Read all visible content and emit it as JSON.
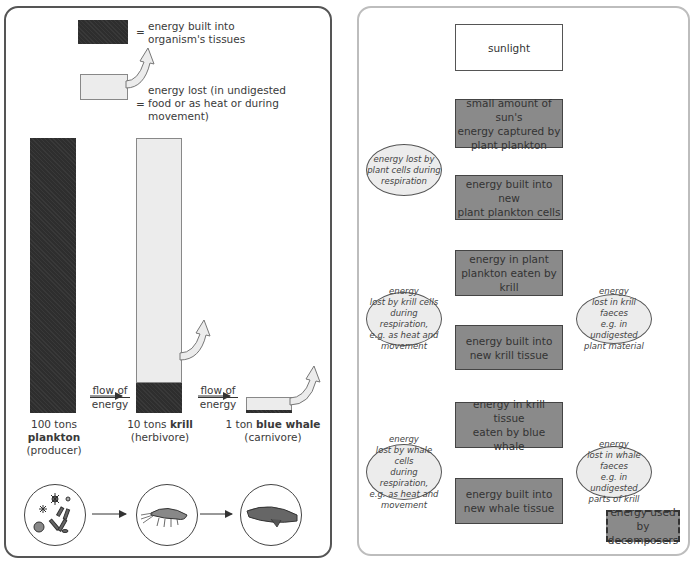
{
  "legend": {
    "dark_label": "= energy built into organism's tissues",
    "dark_label_line1": "energy built into",
    "dark_label_line2": "organism's tissues",
    "light_label_line1": "energy lost (in undigested",
    "light_label_line2": "food or as heat or during",
    "light_label_line3": "movement)",
    "equals": "="
  },
  "pyramid": {
    "flow_label_1": "flow of",
    "flow_label_2": "energy",
    "levels": [
      {
        "amount": "100 tons",
        "organism": "plankton",
        "role": "(producer)",
        "icon": "plankton-icon"
      },
      {
        "amount": "10 tons",
        "organism": "krill",
        "role": "(herbivore)",
        "icon": "krill-icon"
      },
      {
        "amount": "1 ton",
        "organism": "blue whale",
        "role": "(carnivore)",
        "icon": "whale-icon"
      }
    ]
  },
  "flowchart": {
    "sunlight": "sunlight",
    "captured": "small amount of sun's energy captured by plant plankton",
    "captured_l1": "small amount of sun's",
    "captured_l2": "energy captured by",
    "captured_l3": "plant plankton",
    "plant_cells_l1": "energy built into new",
    "plant_cells_l2": "plant plankton cells",
    "eaten_krill_l1": "energy in plant",
    "eaten_krill_l2": "plankton eaten by krill",
    "krill_tissue_l1": "energy built into",
    "krill_tissue_l2": "new krill tissue",
    "eaten_whale_l1": "energy in krill tissue",
    "eaten_whale_l2": "eaten by blue whale",
    "whale_tissue_l1": "energy built into",
    "whale_tissue_l2": "new whale tissue",
    "decomposers_l1": "energy used by",
    "decomposers_l2": "decomposers",
    "loss_plant_resp": [
      "energy lost by",
      "plant cells during",
      "respiration"
    ],
    "loss_krill_resp": [
      "energy",
      "lost by krill cells",
      "during respiration,",
      "e.g. as heat and",
      "movement"
    ],
    "loss_krill_faeces": [
      "energy",
      "lost in krill faeces",
      "e.g. in undigested",
      "plant material"
    ],
    "loss_whale_resp": [
      "energy",
      "lost by whale cells",
      "during respiration,",
      "e.g. as heat and",
      "movement"
    ],
    "loss_whale_faeces": [
      "energy",
      "lost in whale faeces",
      "e.g. in undigested",
      "parts of krill"
    ]
  },
  "colors": {
    "dark_fill": "#2e2e2e",
    "light_fill": "#ececec",
    "box_gray": "#8a8a8a"
  }
}
